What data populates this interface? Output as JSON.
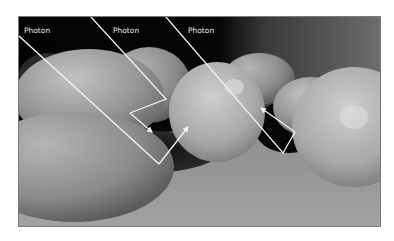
{
  "figure": {
    "labels": [
      "Photon",
      "Photon",
      "Photon"
    ],
    "colors": {
      "ray": "#f2f2f2",
      "background_dark": "#050505",
      "floor": "#9c9c9c",
      "border": "#7a7a7a"
    },
    "photon_paths": [
      {
        "name": "photon-path-1",
        "label": "Photon",
        "bounces": 1,
        "description": "Enters from left, hits floor, reflects up onto orange"
      },
      {
        "name": "photon-path-2",
        "label": "Photon",
        "bounces": 2,
        "description": "Hits orange, reflects to back orange, deflected down into shadow"
      },
      {
        "name": "photon-path-3",
        "label": "Photon",
        "bounces": 2,
        "description": "Passes near orange, hits floor, bounces off right orange, returns into shadow"
      }
    ]
  }
}
